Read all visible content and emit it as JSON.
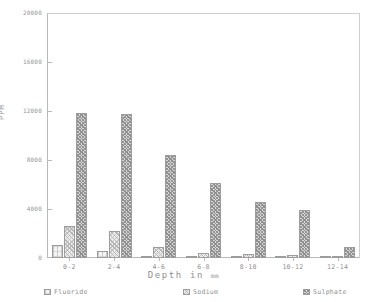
{
  "chart_data": {
    "type": "bar",
    "title": "",
    "xlabel": "Depth in mm",
    "xlabel_main": "Depth in",
    "xlabel_unit": "mm",
    "ylabel": "PPM",
    "ylim": [
      0,
      20000
    ],
    "yticks": [
      0,
      4000,
      8000,
      12000,
      16000,
      20000
    ],
    "ytick_labels": [
      "0",
      "4000",
      "8000",
      "12000",
      "16000",
      "20000"
    ],
    "grid": false,
    "legend_position": "bottom",
    "categories": [
      "0-2",
      "2-4",
      "4-6",
      "6-8",
      "8-10",
      "10-12",
      "12-14"
    ],
    "series": [
      {
        "name": "Fluoride",
        "pattern": "sparse-cross-hatch",
        "color": "#f4f4f4",
        "values": [
          1100,
          600,
          180,
          120,
          90,
          70,
          60
        ]
      },
      {
        "name": "Sodium",
        "pattern": "medium-stipple",
        "color": "#ededed",
        "values": [
          2600,
          2200,
          900,
          420,
          330,
          230,
          180
        ]
      },
      {
        "name": "Sulphate",
        "pattern": "dark-stipple",
        "color": "#d6d6d6",
        "values": [
          11800,
          11750,
          8400,
          6100,
          4600,
          3900,
          900
        ]
      }
    ]
  },
  "legend": {
    "items": [
      {
        "label": "Fluoride"
      },
      {
        "label": "Sodium"
      },
      {
        "label": "Sulphate"
      }
    ]
  }
}
